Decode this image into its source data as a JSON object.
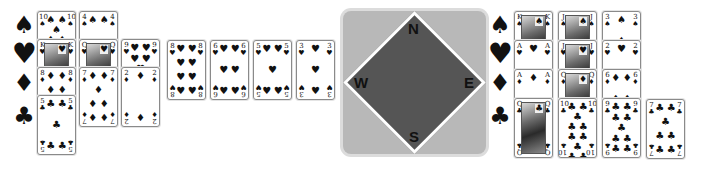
{
  "suit_labels": {
    "left": [
      "♠",
      "♥",
      "♦",
      "♣"
    ],
    "right": [
      "♠",
      "♥",
      "♦",
      "♣"
    ]
  },
  "compass": {
    "north": "N",
    "east": "E",
    "south": "S",
    "west": "W",
    "colors": {
      "frame": "#b8b8b8",
      "diamond": "#555555",
      "border": "#ffffff"
    }
  },
  "left_hand": {
    "columns": [
      {
        "cards": [
          {
            "rank": "10",
            "suit": "♠"
          },
          {
            "rank": "K",
            "suit": "♥"
          },
          {
            "rank": "8",
            "suit": "♦"
          },
          {
            "rank": "5",
            "suit": "♣"
          }
        ]
      },
      {
        "cards": [
          {
            "rank": "4",
            "suit": "♠"
          },
          {
            "rank": "Q",
            "suit": "♥"
          },
          {
            "rank": "7",
            "suit": "♦"
          }
        ]
      },
      {
        "cards": [
          {
            "rank": "9",
            "suit": "♥"
          },
          {
            "rank": "2",
            "suit": "♦"
          }
        ]
      },
      {
        "cards": [
          {
            "rank": "8",
            "suit": "♥"
          }
        ]
      },
      {
        "cards": [
          {
            "rank": "6",
            "suit": "♥"
          }
        ]
      },
      {
        "cards": [
          {
            "rank": "5",
            "suit": "♥"
          }
        ]
      },
      {
        "cards": [
          {
            "rank": "3",
            "suit": "♥"
          }
        ]
      }
    ]
  },
  "right_hand": {
    "columns": [
      {
        "cards": [
          {
            "rank": "K",
            "suit": "♠"
          },
          {
            "rank": "A",
            "suit": "♥"
          },
          {
            "rank": "A",
            "suit": "♦"
          },
          {
            "rank": "Q",
            "suit": "♣"
          }
        ]
      },
      {
        "cards": [
          {
            "rank": "J",
            "suit": "♠"
          },
          {
            "rank": "J",
            "suit": "♥"
          },
          {
            "rank": "Q",
            "suit": "♦"
          },
          {
            "rank": "10",
            "suit": "♣"
          }
        ]
      },
      {
        "cards": [
          {
            "rank": "3",
            "suit": "♠"
          },
          {
            "rank": "2",
            "suit": "♥"
          },
          {
            "rank": "6",
            "suit": "♦"
          },
          {
            "rank": "9",
            "suit": "♣"
          }
        ]
      },
      {
        "cards": [
          {
            "rank": "7",
            "suit": "♣"
          }
        ]
      }
    ]
  }
}
